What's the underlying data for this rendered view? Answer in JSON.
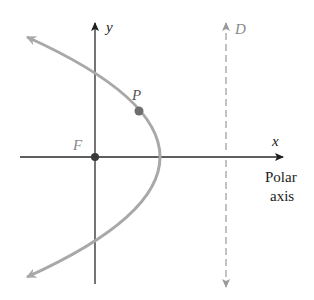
{
  "diagram": {
    "type": "conic-polar-parabola",
    "labels": {
      "y_axis": "y",
      "x_axis": "x",
      "directrix": "D",
      "focus": "F",
      "point": "P",
      "polar_axis_line1": "Polar",
      "polar_axis_line2": "axis"
    },
    "colors": {
      "axes": "#2a2a2a",
      "curve": "#a8a8a8",
      "directrix": "#9a9a9a",
      "point_fill": "#6e6e6e",
      "focus_fill": "#3a3a3a",
      "label_gray": "#8a8a8a",
      "label_dark": "#222222"
    },
    "geometry": {
      "focus": {
        "x": 95,
        "y": 157
      },
      "vertex": {
        "x": 160,
        "y": 157
      },
      "point_p": {
        "x": 139,
        "y": 111
      },
      "directrix_x": 226,
      "curve_ends": [
        {
          "x": 27,
          "y": 37
        },
        {
          "x": 27,
          "y": 277
        }
      ]
    }
  }
}
